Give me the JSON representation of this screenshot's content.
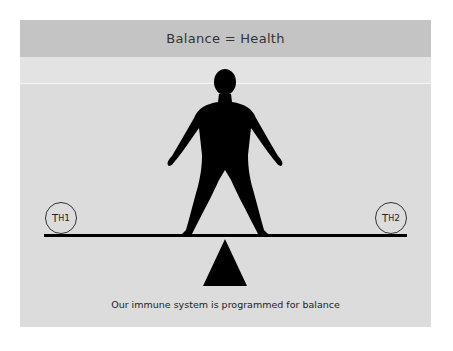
{
  "header": {
    "title": "Balance = Health"
  },
  "diagram": {
    "left_label": {
      "main": "T",
      "sub": "H",
      "sup": "1"
    },
    "right_label": {
      "main": "T",
      "sub": "H",
      "sup": "2"
    },
    "figure": "human-silhouette",
    "fulcrum": "triangle"
  },
  "caption": "Our immune system is programmed for balance",
  "colors": {
    "header_bg": "#c4c4c4",
    "panel_bg": "#dcdcdc",
    "ink": "#000000"
  }
}
